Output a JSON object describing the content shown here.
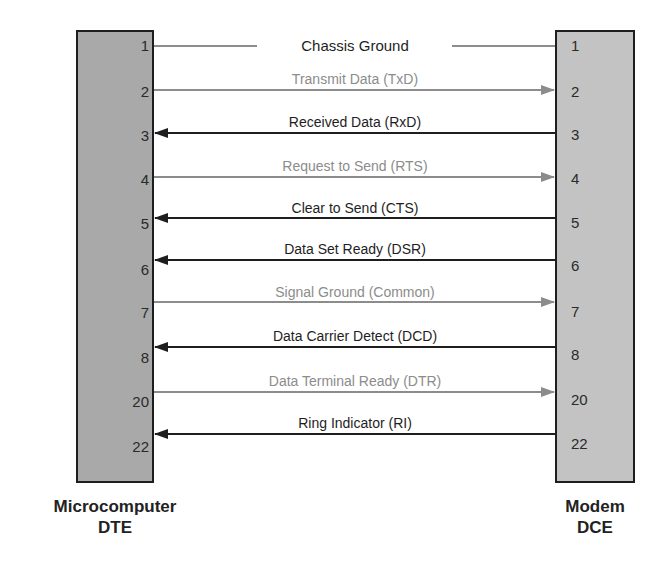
{
  "dte": {
    "title_line1": "Microcomputer",
    "title_line2": "DTE"
  },
  "dce": {
    "title_line1": "Modem",
    "title_line2": "DCE"
  },
  "signals": [
    {
      "pin": "1",
      "label": "Chassis Ground",
      "direction": "none",
      "shade": "dark"
    },
    {
      "pin": "2",
      "label": "Transmit Data (TxD)",
      "direction": "to-dce",
      "shade": "gray"
    },
    {
      "pin": "3",
      "label": "Received Data (RxD)",
      "direction": "to-dte",
      "shade": "dark"
    },
    {
      "pin": "4",
      "label": "Request to Send (RTS)",
      "direction": "to-dce",
      "shade": "gray"
    },
    {
      "pin": "5",
      "label": "Clear to Send (CTS)",
      "direction": "to-dte",
      "shade": "dark"
    },
    {
      "pin": "6",
      "label": "Data Set Ready (DSR)",
      "direction": "to-dte",
      "shade": "dark"
    },
    {
      "pin": "7",
      "label": "Signal Ground (Common)",
      "direction": "to-dce",
      "shade": "gray"
    },
    {
      "pin": "8",
      "label": "Data Carrier Detect (DCD)",
      "direction": "to-dte",
      "shade": "dark"
    },
    {
      "pin": "20",
      "label": "Data Terminal Ready (DTR)",
      "direction": "to-dce",
      "shade": "gray"
    },
    {
      "pin": "22",
      "label": "Ring Indicator (RI)",
      "direction": "to-dte",
      "shade": "dark"
    }
  ],
  "colors": {
    "dark_line": "#1e1e1e",
    "gray_line": "#8c8c8c",
    "dte_fill": "#a9a9a9",
    "dce_fill": "#c3c3c3"
  }
}
